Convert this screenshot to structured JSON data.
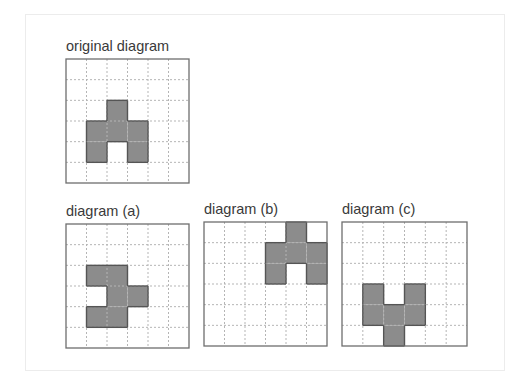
{
  "grid_size": 6,
  "colors": {
    "fill": "#8c8c8c",
    "outline": "#555555",
    "gridline": "#b5b5b5",
    "border": "#6e6e6e"
  },
  "panels": [
    {
      "id": "original",
      "label": "original diagram",
      "filled": [
        [
          2,
          2
        ],
        [
          3,
          1
        ],
        [
          3,
          2
        ],
        [
          3,
          3
        ],
        [
          4,
          1
        ],
        [
          4,
          3
        ]
      ]
    },
    {
      "id": "a",
      "label": "diagram (a)",
      "filled": [
        [
          2,
          1
        ],
        [
          2,
          2
        ],
        [
          3,
          2
        ],
        [
          3,
          3
        ],
        [
          4,
          1
        ],
        [
          4,
          2
        ]
      ]
    },
    {
      "id": "b",
      "label": "diagram (b)",
      "filled": [
        [
          0,
          4
        ],
        [
          1,
          3
        ],
        [
          1,
          4
        ],
        [
          1,
          5
        ],
        [
          2,
          3
        ],
        [
          2,
          5
        ]
      ]
    },
    {
      "id": "c",
      "label": "diagram (c)",
      "filled": [
        [
          3,
          1
        ],
        [
          3,
          3
        ],
        [
          4,
          1
        ],
        [
          4,
          2
        ],
        [
          4,
          3
        ],
        [
          5,
          2
        ]
      ]
    }
  ]
}
